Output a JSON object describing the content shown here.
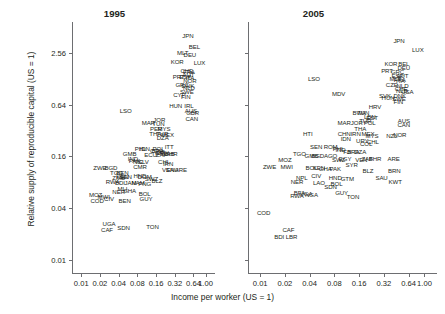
{
  "chart_data": {
    "type": "scatter",
    "title": "",
    "xlabel": "Income per worker (US = 1)",
    "ylabel": "Relative supply of reproducible capital (US = 1)",
    "xscale": "log",
    "yscale": "log",
    "xticks": [
      "0.01",
      "0.02",
      "0.04",
      "0.08",
      "0.16",
      "0.32",
      "0.64",
      "1.00"
    ],
    "yticks": [
      "2.56",
      "0.64",
      "0.16",
      "0.04",
      "0.01"
    ],
    "xlim": [
      0.0071,
      1.42
    ],
    "ylim": [
      0.0071,
      5.8
    ],
    "grid": false,
    "legend": null,
    "panels": [
      {
        "title": "1995",
        "points": [
          {
            "label": "JPN",
            "x": 0.52,
            "y": 4.05
          },
          {
            "label": "BEL",
            "x": 0.66,
            "y": 3.05
          },
          {
            "label": "MLT",
            "x": 0.43,
            "y": 2.6
          },
          {
            "label": "DEU",
            "x": 0.56,
            "y": 2.44
          },
          {
            "label": "KOR",
            "x": 0.35,
            "y": 2.05
          },
          {
            "label": "LUX",
            "x": 0.8,
            "y": 2.0
          },
          {
            "label": "CHE",
            "x": 0.5,
            "y": 1.62
          },
          {
            "label": "FRA",
            "x": 0.54,
            "y": 1.58
          },
          {
            "label": "AUT",
            "x": 0.53,
            "y": 1.46
          },
          {
            "label": "ESP",
            "x": 0.47,
            "y": 1.38
          },
          {
            "label": "PRT",
            "x": 0.37,
            "y": 1.36
          },
          {
            "label": "ITA",
            "x": 0.56,
            "y": 1.34
          },
          {
            "label": "NOR",
            "x": 0.56,
            "y": 1.22
          },
          {
            "label": "GRC",
            "x": 0.42,
            "y": 1.1
          },
          {
            "label": "DNK",
            "x": 0.52,
            "y": 1.07
          },
          {
            "label": "NLD",
            "x": 0.54,
            "y": 1.02
          },
          {
            "label": "SWE",
            "x": 0.5,
            "y": 0.93
          },
          {
            "label": "CYP",
            "x": 0.38,
            "y": 0.84
          },
          {
            "label": "FIN",
            "x": 0.48,
            "y": 0.81
          },
          {
            "label": "HUN",
            "x": 0.33,
            "y": 0.63
          },
          {
            "label": "IRL",
            "x": 0.54,
            "y": 0.63
          },
          {
            "label": "AUS",
            "x": 0.58,
            "y": 0.56
          },
          {
            "label": "GBR",
            "x": 0.62,
            "y": 0.52
          },
          {
            "label": "CAN",
            "x": 0.6,
            "y": 0.45
          },
          {
            "label": "LSO",
            "x": 0.052,
            "y": 0.56
          },
          {
            "label": "MAR",
            "x": 0.12,
            "y": 0.4
          },
          {
            "label": "JOR",
            "x": 0.18,
            "y": 0.44
          },
          {
            "label": "TUN",
            "x": 0.175,
            "y": 0.39
          },
          {
            "label": "PER",
            "x": 0.16,
            "y": 0.34
          },
          {
            "label": "MYS",
            "x": 0.215,
            "y": 0.34
          },
          {
            "label": "THA",
            "x": 0.155,
            "y": 0.3
          },
          {
            "label": "TUR",
            "x": 0.2,
            "y": 0.3
          },
          {
            "label": "MEX",
            "x": 0.245,
            "y": 0.29
          },
          {
            "label": "DZA",
            "x": 0.205,
            "y": 0.27
          },
          {
            "label": "PHL",
            "x": 0.09,
            "y": 0.2
          },
          {
            "label": "IDN",
            "x": 0.105,
            "y": 0.2
          },
          {
            "label": "ECU",
            "x": 0.13,
            "y": 0.17
          },
          {
            "label": "COL",
            "x": 0.16,
            "y": 0.19
          },
          {
            "label": "BRA",
            "x": 0.17,
            "y": 0.19
          },
          {
            "label": "POL",
            "x": 0.175,
            "y": 0.2
          },
          {
            "label": "CRI",
            "x": 0.185,
            "y": 0.18
          },
          {
            "label": "URY",
            "x": 0.205,
            "y": 0.18
          },
          {
            "label": "ZAF",
            "x": 0.195,
            "y": 0.17
          },
          {
            "label": "ITT",
            "x": 0.26,
            "y": 0.21
          },
          {
            "label": "GAB",
            "x": 0.25,
            "y": 0.175
          },
          {
            "label": "BHR",
            "x": 0.28,
            "y": 0.175
          },
          {
            "label": "GMB",
            "x": 0.06,
            "y": 0.175
          },
          {
            "label": "IND",
            "x": 0.068,
            "y": 0.155
          },
          {
            "label": "PAK",
            "x": 0.072,
            "y": 0.145
          },
          {
            "label": "NIC",
            "x": 0.082,
            "y": 0.14
          },
          {
            "label": "SLV",
            "x": 0.1,
            "y": 0.14
          },
          {
            "label": "CMR",
            "x": 0.088,
            "y": 0.125
          },
          {
            "label": "CHL",
            "x": 0.215,
            "y": 0.14
          },
          {
            "label": "IRN",
            "x": 0.25,
            "y": 0.135
          },
          {
            "label": "VEN",
            "x": 0.25,
            "y": 0.115
          },
          {
            "label": "ZWE",
            "x": 0.02,
            "y": 0.12
          },
          {
            "label": "BGD",
            "x": 0.03,
            "y": 0.12
          },
          {
            "label": "TGO",
            "x": 0.037,
            "y": 0.105
          },
          {
            "label": "BEN",
            "x": 0.046,
            "y": 0.105
          },
          {
            "label": "ZMB",
            "x": 0.04,
            "y": 0.093
          },
          {
            "label": "KEN",
            "x": 0.046,
            "y": 0.095
          },
          {
            "label": "SEN",
            "x": 0.052,
            "y": 0.095
          },
          {
            "label": "HND",
            "x": 0.088,
            "y": 0.097
          },
          {
            "label": "DOM",
            "x": 0.105,
            "y": 0.095
          },
          {
            "label": "SWZ",
            "x": 0.135,
            "y": 0.09
          },
          {
            "label": "BLZ",
            "x": 0.165,
            "y": 0.085
          },
          {
            "label": "SAU",
            "x": 0.29,
            "y": 0.115
          },
          {
            "label": "ARE",
            "x": 0.4,
            "y": 0.115
          },
          {
            "label": "RWA",
            "x": 0.032,
            "y": 0.082
          },
          {
            "label": "BDI",
            "x": 0.042,
            "y": 0.08
          },
          {
            "label": "JAM",
            "x": 0.062,
            "y": 0.08
          },
          {
            "label": "NAM",
            "x": 0.082,
            "y": 0.08
          },
          {
            "label": "PNG",
            "x": 0.105,
            "y": 0.078
          },
          {
            "label": "MLI",
            "x": 0.046,
            "y": 0.068
          },
          {
            "label": "GHA",
            "x": 0.06,
            "y": 0.066
          },
          {
            "label": "NER",
            "x": 0.04,
            "y": 0.063
          },
          {
            "label": "MOZ",
            "x": 0.017,
            "y": 0.058
          },
          {
            "label": "MWI",
            "x": 0.023,
            "y": 0.056
          },
          {
            "label": "COD",
            "x": 0.018,
            "y": 0.05
          },
          {
            "label": "CIV",
            "x": 0.028,
            "y": 0.053
          },
          {
            "label": "BEN",
            "x": 0.05,
            "y": 0.05
          },
          {
            "label": "BOL",
            "x": 0.105,
            "y": 0.06
          },
          {
            "label": "GUY",
            "x": 0.11,
            "y": 0.052
          },
          {
            "label": "UGA",
            "x": 0.028,
            "y": 0.027
          },
          {
            "label": "CAF",
            "x": 0.026,
            "y": 0.023
          },
          {
            "label": "SDN",
            "x": 0.048,
            "y": 0.024
          },
          {
            "label": "TON",
            "x": 0.14,
            "y": 0.025
          }
        ]
      },
      {
        "title": "2005",
        "points": [
          {
            "label": "JPN",
            "x": 0.49,
            "y": 3.6
          },
          {
            "label": "LUX",
            "x": 0.83,
            "y": 2.85
          },
          {
            "label": "KOR",
            "x": 0.39,
            "y": 1.95
          },
          {
            "label": "BEL",
            "x": 0.56,
            "y": 1.95
          },
          {
            "label": "DEU",
            "x": 0.56,
            "y": 1.72
          },
          {
            "label": "PRT",
            "x": 0.35,
            "y": 1.6
          },
          {
            "label": "GRC",
            "x": 0.47,
            "y": 1.58
          },
          {
            "label": "ESP",
            "x": 0.47,
            "y": 1.42
          },
          {
            "label": "AUT",
            "x": 0.54,
            "y": 1.4
          },
          {
            "label": "MLT",
            "x": 0.44,
            "y": 1.3
          },
          {
            "label": "FRA",
            "x": 0.5,
            "y": 1.25
          },
          {
            "label": "ITA",
            "x": 0.51,
            "y": 1.22
          },
          {
            "label": "CZE",
            "x": 0.4,
            "y": 1.1
          },
          {
            "label": "NLD",
            "x": 0.54,
            "y": 1.08
          },
          {
            "label": "CHE",
            "x": 0.52,
            "y": 1.0
          },
          {
            "label": "NLD2",
            "x": 0.53,
            "y": 0.95
          },
          {
            "label": "USA",
            "x": 0.62,
            "y": 0.92
          },
          {
            "label": "LSO",
            "x": 0.045,
            "y": 1.3
          },
          {
            "label": "MDV",
            "x": 0.09,
            "y": 0.88
          },
          {
            "label": "SVK",
            "x": 0.33,
            "y": 0.83
          },
          {
            "label": "DNK",
            "x": 0.5,
            "y": 0.82
          },
          {
            "label": "HUN",
            "x": 0.36,
            "y": 0.78
          },
          {
            "label": "SWE",
            "x": 0.49,
            "y": 0.76
          },
          {
            "label": "FIN",
            "x": 0.48,
            "y": 0.7
          },
          {
            "label": "HRV",
            "x": 0.25,
            "y": 0.62
          },
          {
            "label": "BWA",
            "x": 0.16,
            "y": 0.52
          },
          {
            "label": "TUN",
            "x": 0.18,
            "y": 0.52
          },
          {
            "label": "LBN",
            "x": 0.215,
            "y": 0.47
          },
          {
            "label": "EST",
            "x": 0.23,
            "y": 0.46
          },
          {
            "label": "MAR",
            "x": 0.105,
            "y": 0.4
          },
          {
            "label": "JOR",
            "x": 0.15,
            "y": 0.4
          },
          {
            "label": "TUR",
            "x": 0.19,
            "y": 0.42
          },
          {
            "label": "POL",
            "x": 0.215,
            "y": 0.4
          },
          {
            "label": "AUS",
            "x": 0.56,
            "y": 0.42
          },
          {
            "label": "CAN",
            "x": 0.56,
            "y": 0.38
          },
          {
            "label": "THA",
            "x": 0.165,
            "y": 0.34
          },
          {
            "label": "CHN",
            "x": 0.105,
            "y": 0.3
          },
          {
            "label": "IRN",
            "x": 0.145,
            "y": 0.3
          },
          {
            "label": "MEX",
            "x": 0.205,
            "y": 0.3
          },
          {
            "label": "MYS",
            "x": 0.23,
            "y": 0.28
          },
          {
            "label": "NZL",
            "x": 0.4,
            "y": 0.28
          },
          {
            "label": "NOR",
            "x": 0.5,
            "y": 0.29
          },
          {
            "label": "IDN",
            "x": 0.11,
            "y": 0.26
          },
          {
            "label": "URY",
            "x": 0.175,
            "y": 0.25
          },
          {
            "label": "CHL",
            "x": 0.235,
            "y": 0.24
          },
          {
            "label": "COL",
            "x": 0.195,
            "y": 0.23
          },
          {
            "label": "HTI",
            "x": 0.038,
            "y": 0.3
          },
          {
            "label": "SEN",
            "x": 0.048,
            "y": 0.21
          },
          {
            "label": "ROM",
            "x": 0.072,
            "y": 0.21
          },
          {
            "label": "PHL",
            "x": 0.09,
            "y": 0.2
          },
          {
            "label": "IND",
            "x": 0.095,
            "y": 0.195
          },
          {
            "label": "FJI",
            "x": 0.115,
            "y": 0.185
          },
          {
            "label": "BRA",
            "x": 0.135,
            "y": 0.185
          },
          {
            "label": "DZA",
            "x": 0.165,
            "y": 0.185
          },
          {
            "label": "TGO",
            "x": 0.03,
            "y": 0.175
          },
          {
            "label": "GMB",
            "x": 0.042,
            "y": 0.165
          },
          {
            "label": "BGD",
            "x": 0.05,
            "y": 0.165
          },
          {
            "label": "AGO",
            "x": 0.072,
            "y": 0.165
          },
          {
            "label": "EGY",
            "x": 0.108,
            "y": 0.155
          },
          {
            "label": "SWZ",
            "x": 0.09,
            "y": 0.15
          },
          {
            "label": "VEN",
            "x": 0.17,
            "y": 0.15
          },
          {
            "label": "ZAF",
            "x": 0.2,
            "y": 0.155
          },
          {
            "label": "BHR",
            "x": 0.25,
            "y": 0.155
          },
          {
            "label": "MOZ",
            "x": 0.02,
            "y": 0.15
          },
          {
            "label": "ARE",
            "x": 0.42,
            "y": 0.155
          },
          {
            "label": "ZWE",
            "x": 0.013,
            "y": 0.125
          },
          {
            "label": "MWI",
            "x": 0.021,
            "y": 0.125
          },
          {
            "label": "BOL",
            "x": 0.042,
            "y": 0.12
          },
          {
            "label": "KEN",
            "x": 0.052,
            "y": 0.12
          },
          {
            "label": "GHA",
            "x": 0.062,
            "y": 0.118
          },
          {
            "label": "PAK",
            "x": 0.082,
            "y": 0.118
          },
          {
            "label": "SYR",
            "x": 0.13,
            "y": 0.13
          },
          {
            "label": "BRN",
            "x": 0.43,
            "y": 0.11
          },
          {
            "label": "BLZ",
            "x": 0.205,
            "y": 0.11
          },
          {
            "label": "NPL",
            "x": 0.032,
            "y": 0.092
          },
          {
            "label": "CIV",
            "x": 0.048,
            "y": 0.098
          },
          {
            "label": "HND",
            "x": 0.082,
            "y": 0.092
          },
          {
            "label": "GTM",
            "x": 0.115,
            "y": 0.09
          },
          {
            "label": "SAU",
            "x": 0.3,
            "y": 0.092
          },
          {
            "label": "NER",
            "x": 0.028,
            "y": 0.082
          },
          {
            "label": "LAO",
            "x": 0.052,
            "y": 0.08
          },
          {
            "label": "SDN",
            "x": 0.072,
            "y": 0.072
          },
          {
            "label": "BOL2",
            "x": 0.085,
            "y": 0.078
          },
          {
            "label": "KWT",
            "x": 0.44,
            "y": 0.082
          },
          {
            "label": "BFA",
            "x": 0.03,
            "y": 0.062
          },
          {
            "label": "RWA",
            "x": 0.028,
            "y": 0.057
          },
          {
            "label": "UGA",
            "x": 0.036,
            "y": 0.06
          },
          {
            "label": "NGA",
            "x": 0.042,
            "y": 0.058
          },
          {
            "label": "GUY",
            "x": 0.098,
            "y": 0.062
          },
          {
            "label": "TON",
            "x": 0.135,
            "y": 0.055
          },
          {
            "label": "COD",
            "x": 0.011,
            "y": 0.036
          },
          {
            "label": "CAF",
            "x": 0.022,
            "y": 0.023
          },
          {
            "label": "BDI",
            "x": 0.017,
            "y": 0.019
          },
          {
            "label": "LBR",
            "x": 0.024,
            "y": 0.019
          }
        ]
      }
    ]
  }
}
